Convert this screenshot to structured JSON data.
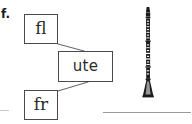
{
  "exercise": {
    "item_label": "f.",
    "boxes": [
      {
        "id": "fl",
        "text": "fl"
      },
      {
        "id": "ute",
        "text": "ute"
      },
      {
        "id": "fr",
        "text": "fr"
      }
    ],
    "connectors": [
      {
        "from": "fl",
        "to": "ute",
        "x1": 58,
        "y1": 44,
        "x2": 84,
        "y2": 51
      },
      {
        "from": "fr",
        "to": "ute",
        "x1": 58,
        "y1": 91,
        "x2": 88,
        "y2": 82
      }
    ],
    "illustration": {
      "name": "clarinet-illustration",
      "alt": "clarinet"
    },
    "answer_line": {
      "shown": true
    }
  },
  "colors": {
    "ink": "#2b2b2b",
    "box_border": "#4a4a4a",
    "connector": "#6b6b6b",
    "rule": "#9a9a9a",
    "instrument_body": "#1c1c1c",
    "instrument_key": "#ffffff",
    "page_background": "#ffffff"
  }
}
